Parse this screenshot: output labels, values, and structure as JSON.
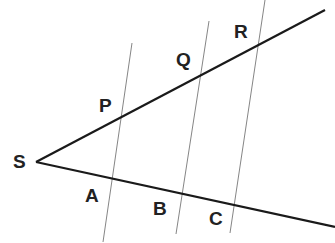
{
  "diagram": {
    "colors": {
      "ray": "#1a1a1a",
      "transversal": "#555555",
      "label": "#222222"
    },
    "labels": {
      "S": "S",
      "P": "P",
      "Q": "Q",
      "R": "R",
      "A": "A",
      "B": "B",
      "C": "C"
    },
    "points": {
      "S": [
        36,
        162
      ],
      "P": [
        120,
        118
      ],
      "Q": [
        201,
        75
      ],
      "R": [
        258,
        45
      ],
      "A": [
        111,
        178
      ],
      "B": [
        182,
        193
      ],
      "C": [
        234,
        204
      ]
    },
    "rays": [
      {
        "name": "upper-ray",
        "from": "S",
        "through": [
          "P",
          "Q",
          "R"
        ]
      },
      {
        "name": "lower-ray",
        "from": "S",
        "through": [
          "A",
          "B",
          "C"
        ]
      }
    ],
    "transversals": [
      {
        "name": "transversal-PA",
        "through": [
          "P",
          "A"
        ]
      },
      {
        "name": "transversal-QB",
        "through": [
          "Q",
          "B"
        ]
      },
      {
        "name": "transversal-RC",
        "through": [
          "R",
          "C"
        ]
      }
    ]
  }
}
